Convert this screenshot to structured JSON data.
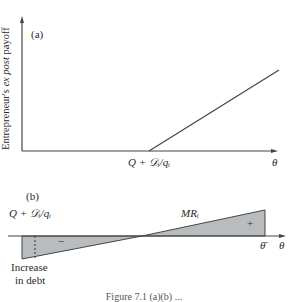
{
  "panel_a": {
    "tag": "(a)",
    "y_axis_label_prefix": "Entrepreneur's ",
    "y_axis_label_italic": "ex post",
    "y_axis_label_suffix": " payoff",
    "x_axis_label": "θ",
    "kink_label": "Q + 𝒟ᵢ/qᵢ"
  },
  "panel_b": {
    "tag": "(b)",
    "threshold_label": "Q + 𝒟ᵢ/qᵢ",
    "curve_label": "MRᵢ",
    "negative_sign": "−",
    "positive_sign": "+",
    "theta_bar_label": "θ̄",
    "x_axis_label": "θ",
    "annotation_line1": "Increase",
    "annotation_line2": "in debt"
  },
  "caption": "Figure 7.1 (a)(b) ..."
}
